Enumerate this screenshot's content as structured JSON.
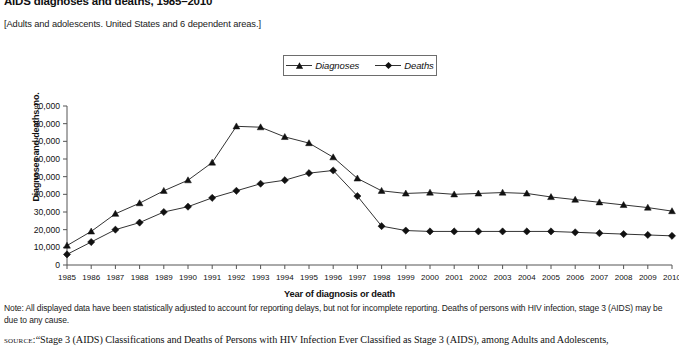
{
  "figure": {
    "title": "AIDS diagnoses and deaths, 1985–2010",
    "subtitle": "[Adults and adolescents. United States and 6 dependent areas.]",
    "note": "Note: All displayed data have been statistically adjusted to account for reporting delays, but not for incomplete reporting. Deaths of persons with HIV infection, stage 3 (AIDS) may be due to any cause.",
    "source_keyword": "source:",
    "source_text": "“Stage 3 (AIDS) Classifications and Deaths of Persons with HIV Infection Ever Classified as Stage 3 (AIDS), among Adults and Adolescents,"
  },
  "legend": {
    "position": "top-center",
    "items": [
      {
        "label": "Diagnoses",
        "marker": "triangle",
        "color": "#111111"
      },
      {
        "label": "Deaths",
        "marker": "diamond",
        "color": "#111111"
      }
    ]
  },
  "chart_data": {
    "type": "line",
    "title": "AIDS diagnoses and deaths, 1985–2010",
    "xlabel": "Year of diagnosis or death",
    "ylabel": "Diagnoses and deaths, no.",
    "grid": false,
    "legend_position": "top-center",
    "xlim": [
      1985,
      2010
    ],
    "ylim": [
      0,
      90000
    ],
    "ytick_step": 10000,
    "ytick_labels": [
      "0",
      "10,000",
      "20,000",
      "30,000",
      "40,000",
      "50,000",
      "60,000",
      "70,000",
      "80,000",
      "90,000"
    ],
    "categories": [
      1985,
      1986,
      1987,
      1988,
      1989,
      1990,
      1991,
      1992,
      1993,
      1994,
      1995,
      1996,
      1997,
      1998,
      1999,
      2000,
      2001,
      2002,
      2003,
      2004,
      2005,
      2006,
      2007,
      2008,
      2009,
      2010
    ],
    "x": [
      "1985",
      "1986",
      "1987",
      "1988",
      "1989",
      "1990",
      "1991",
      "1992",
      "1993",
      "1994",
      "1995",
      "1996",
      "1997",
      "1998",
      "1999",
      "2000",
      "2001",
      "2002",
      "2003",
      "2004",
      "2005",
      "2006",
      "2007",
      "2008",
      "2009",
      "2010"
    ],
    "series": [
      {
        "name": "Diagnoses",
        "marker": "triangle",
        "color": "#111111",
        "values": [
          11000,
          19000,
          29000,
          35000,
          42000,
          48000,
          58000,
          78500,
          78000,
          72500,
          69000,
          61000,
          49000,
          42000,
          40500,
          41000,
          40000,
          40500,
          41000,
          40500,
          38500,
          37000,
          35500,
          34000,
          32500,
          30500
        ]
      },
      {
        "name": "Deaths",
        "marker": "diamond",
        "color": "#111111",
        "values": [
          6000,
          13000,
          20000,
          24000,
          30000,
          33000,
          38000,
          42000,
          46000,
          48000,
          52000,
          53500,
          39000,
          22000,
          19500,
          19000,
          19000,
          19000,
          19000,
          19000,
          19000,
          18500,
          18000,
          17500,
          17000,
          16500
        ]
      }
    ]
  }
}
